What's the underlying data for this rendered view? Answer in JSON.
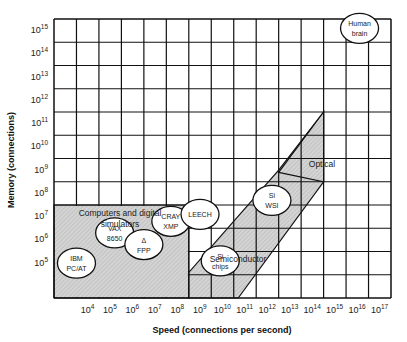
{
  "chart_data": {
    "type": "area",
    "title": "",
    "xlabel": "Speed (connections per second)",
    "ylabel": "Memory (connections)",
    "x_scale": "log10",
    "y_scale": "log10",
    "xlim_exp": [
      3,
      18
    ],
    "ylim_exp": [
      3,
      15
    ],
    "grid": true,
    "x_ticks": [
      {
        "base": "10",
        "exp": "4"
      },
      {
        "base": "10",
        "exp": "5"
      },
      {
        "base": "10",
        "exp": "6"
      },
      {
        "base": "10",
        "exp": "7"
      },
      {
        "base": "10",
        "exp": "8"
      },
      {
        "base": "10",
        "exp": "9"
      },
      {
        "base": "10",
        "exp": "10"
      },
      {
        "base": "10",
        "exp": "11"
      },
      {
        "base": "10",
        "exp": "12"
      },
      {
        "base": "10",
        "exp": "13"
      },
      {
        "base": "10",
        "exp": "14"
      },
      {
        "base": "10",
        "exp": "15"
      },
      {
        "base": "10",
        "exp": "16"
      },
      {
        "base": "10",
        "exp": "17"
      }
    ],
    "y_ticks": [
      {
        "base": "10",
        "exp": "5"
      },
      {
        "base": "10",
        "exp": "6"
      },
      {
        "base": "10",
        "exp": "7"
      },
      {
        "base": "10",
        "exp": "8"
      },
      {
        "base": "10",
        "exp": "9"
      },
      {
        "base": "10",
        "exp": "10"
      },
      {
        "base": "10",
        "exp": "11"
      },
      {
        "base": "10",
        "exp": "12"
      },
      {
        "base": "10",
        "exp": "13"
      },
      {
        "base": "10",
        "exp": "14"
      },
      {
        "base": "10",
        "exp": "15"
      }
    ],
    "regions": [
      {
        "name": "Computers and digital simulators",
        "label_line1": "Computers and digital",
        "label_line2": "simulators",
        "polygon_exp": [
          [
            3,
            3
          ],
          [
            9,
            3
          ],
          [
            9,
            7
          ],
          [
            3,
            7
          ]
        ]
      },
      {
        "name": "Semiconductor",
        "label": "Semiconductor",
        "polygon_exp": [
          [
            9,
            3
          ],
          [
            11.2,
            3
          ],
          [
            15,
            8
          ],
          [
            15,
            11
          ],
          [
            13,
            8.5
          ],
          [
            9,
            4.1
          ]
        ]
      },
      {
        "name": "Optical",
        "label": "Optical",
        "polygon_exp": [
          [
            13,
            8.4
          ],
          [
            15,
            8
          ],
          [
            15,
            11
          ],
          [
            13,
            8.4
          ]
        ]
      }
    ],
    "systems": [
      {
        "name": "IBM PC/AT",
        "line1": "IBM",
        "line2": "PC/AT",
        "x_exp": 4,
        "y_exp": 4.5
      },
      {
        "name": "VAX 8650",
        "line1": "VAX",
        "line2": "8650",
        "x_exp": 5.7,
        "y_exp": 5.8
      },
      {
        "name": "Δ FPP",
        "line1": "Δ",
        "line2": "FPP",
        "x_exp": 7,
        "y_exp": 5.3
      },
      {
        "name": "CRAY XMP",
        "line1": "CRAY",
        "line2": "XMP",
        "x_exp": 8.2,
        "y_exp": 6.3
      },
      {
        "name": "LEECH",
        "line1": "LEECH",
        "line2": "",
        "x_exp": 9.5,
        "y_exp": 6.6
      },
      {
        "name": "Si chips",
        "line1": "Si",
        "line2": "chips",
        "x_exp": 10.4,
        "y_exp": 4.6
      },
      {
        "name": "Si WSI",
        "line1": "Si",
        "line2": "WSI",
        "x_exp": 12.7,
        "y_exp": 7.2
      },
      {
        "name": "Human brain",
        "line1": "Human",
        "line2": "brain",
        "x_exp": 16.6,
        "y_exp": 14.6
      }
    ]
  }
}
